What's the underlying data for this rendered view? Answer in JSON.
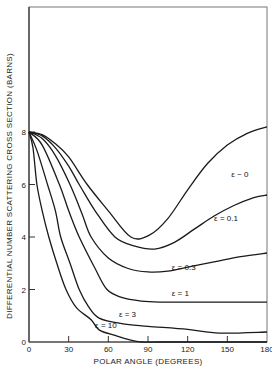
{
  "chart_data": {
    "type": "line",
    "title": "",
    "xlabel": "POLAR ANGLE (DEGREES)",
    "ylabel": "DIFFERENTIAL NUMBER SCATTERING CROSS SECTION (BARNS)",
    "xlim": [
      0,
      180
    ],
    "ylim": [
      0,
      12.6
    ],
    "xticks": [
      "0",
      "30",
      "60",
      "90",
      "120",
      "150",
      "180"
    ],
    "yticks": [
      "0",
      "2",
      "4",
      "6",
      "8"
    ],
    "grid": false,
    "legend": "none (inline curve labels)",
    "series": [
      {
        "name": "ε ~ 0",
        "label": "ε ~ 0",
        "x": [
          0,
          10,
          20,
          30,
          44,
          60,
          77,
          91,
          105,
          120,
          135,
          150,
          165,
          180
        ],
        "y": [
          8,
          7.9,
          7.55,
          7.05,
          6,
          5.0,
          4.0,
          4.07,
          4.7,
          5.8,
          6.8,
          7.5,
          7.95,
          8.2
        ]
      },
      {
        "name": "ε = 0.1",
        "label": "ε = 0.1",
        "x": [
          0,
          10,
          20,
          30,
          38,
          50,
          65,
          80,
          95,
          110,
          125,
          140,
          155,
          170,
          180
        ],
        "y": [
          8,
          7.85,
          7.4,
          6.7,
          6,
          5.0,
          4.0,
          3.65,
          3.54,
          3.8,
          4.3,
          4.8,
          5.2,
          5.5,
          5.6
        ]
      },
      {
        "name": "ε = 0.3",
        "label": "ε = 0.3",
        "x": [
          0,
          10,
          20,
          31,
          40,
          47,
          60,
          75,
          90,
          105,
          120,
          140,
          160,
          180
        ],
        "y": [
          8,
          7.75,
          7.1,
          6,
          4.9,
          4.0,
          3.2,
          2.8,
          2.67,
          2.7,
          2.85,
          3.05,
          3.25,
          3.39
        ]
      },
      {
        "name": "ε = 1",
        "label": "ε = 1",
        "x": [
          0,
          10,
          23,
          30,
          38,
          50,
          59,
          70,
          85,
          100,
          120,
          150,
          180
        ],
        "y": [
          8,
          7.5,
          6,
          5.0,
          4.0,
          2.8,
          2.0,
          1.7,
          1.56,
          1.52,
          1.52,
          1.52,
          1.52
        ]
      },
      {
        "name": "ε = 3",
        "label": "ε = 3",
        "x": [
          0,
          6,
          14,
          20,
          24,
          31,
          38,
          45,
          53,
          70,
          90,
          120,
          144,
          180
        ],
        "y": [
          8,
          7.3,
          6,
          5.0,
          4.0,
          3.0,
          2.0,
          1.35,
          0.91,
          0.7,
          0.6,
          0.48,
          0.34,
          0.38
        ]
      },
      {
        "name": "ε = 10",
        "label": "ε = 10",
        "x": [
          0,
          3,
          6,
          10,
          15,
          21,
          28,
          36,
          47,
          53,
          65,
          75,
          86,
          100,
          180
        ],
        "y": [
          8,
          7.4,
          6,
          5.0,
          4.0,
          3.0,
          2.0,
          1.3,
          0.85,
          0.46,
          0.25,
          0.1,
          0.0,
          0.0,
          0.0
        ]
      }
    ],
    "annotations": [
      {
        "text": "ε ~ 0",
        "x": 153,
        "y": 6.3
      },
      {
        "text": "ε = 0.1",
        "x": 140,
        "y": 4.6
      },
      {
        "text": "ε = 0.3",
        "x": 108,
        "y": 2.75
      },
      {
        "text": "ε = 1",
        "x": 108,
        "y": 1.75
      },
      {
        "text": "ε = 3",
        "x": 68,
        "y": 0.95
      },
      {
        "text": "ε = 10",
        "x": 50,
        "y": 0.55
      }
    ]
  }
}
